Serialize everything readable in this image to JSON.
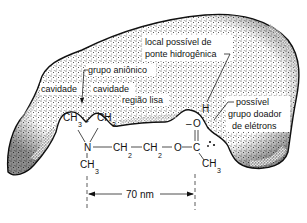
{
  "diagram": {
    "type": "receptor-binding-site",
    "labels": {
      "hydrogen_bond_site": [
        "local possível de",
        "ponte hidrogênica"
      ],
      "anionic_group": "grupo aniônico",
      "cavity_left": "cavidade",
      "cavity_right": "cavidade",
      "flat_region": "região lisa",
      "electron_donor": [
        "possível",
        "grupo doador",
        "de elétrons"
      ]
    },
    "molecule": {
      "name": "acetylcholine",
      "n_methyl_left": "CH",
      "n_methyl_right": "CH",
      "n_methyl_bottom": "CH",
      "methyl_sub": "3",
      "charge": "+",
      "nitrogen": "N",
      "ch2_a": "CH",
      "ch2_b": "CH",
      "ch2_sub": "2",
      "ester_oxygen": "O",
      "carbonyl_carbon": "C",
      "carbonyl_oxygen": "O",
      "hydrogen": "H",
      "acetyl_methyl": "CH",
      "dash": "–"
    },
    "dimension": {
      "label": "70 nm"
    },
    "colors": {
      "ink": "#111111",
      "background": "#ffffff"
    }
  }
}
